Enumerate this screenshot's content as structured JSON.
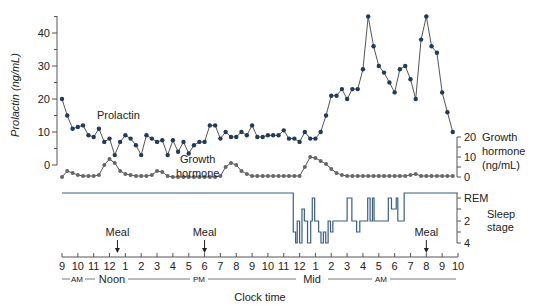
{
  "chart_data": {
    "type": "line",
    "title": "",
    "xlabel": "Clock time",
    "x_tick_labels": [
      "9",
      "10",
      "11",
      "12",
      "1",
      "2",
      "3",
      "4",
      "5",
      "6",
      "7",
      "8",
      "9",
      "10",
      "11",
      "12",
      "1",
      "2",
      "3",
      "4",
      "5",
      "6",
      "7",
      "8",
      "9",
      "10"
    ],
    "x_period_labels": [
      "AM",
      "Noon",
      "PM",
      "Mid",
      "AM"
    ],
    "x_range_hours": [
      9,
      34
    ],
    "panels": [
      {
        "name": "prolactin",
        "ylabel": "Prolactin (ng/mL)",
        "yticks": [
          0,
          10,
          20,
          30,
          40
        ],
        "ylim": [
          0,
          45
        ],
        "series_label": "Prolactin",
        "color": "#1f3a5a",
        "x": [
          9.0,
          9.33,
          9.67,
          10.0,
          10.33,
          10.67,
          11.0,
          11.33,
          11.67,
          12.0,
          12.33,
          12.67,
          13.0,
          13.33,
          13.67,
          14.0,
          14.33,
          14.67,
          15.0,
          15.33,
          15.67,
          16.0,
          16.33,
          16.67,
          17.0,
          17.33,
          17.67,
          18.0,
          18.33,
          18.67,
          19.0,
          19.33,
          19.67,
          20.0,
          20.33,
          20.67,
          21.0,
          21.33,
          21.67,
          22.0,
          22.33,
          22.67,
          23.0,
          23.33,
          23.67,
          24.0,
          24.33,
          24.67,
          25.0,
          25.33,
          25.67,
          26.0,
          26.33,
          26.67,
          27.0,
          27.33,
          27.67,
          28.0,
          28.33,
          28.67,
          29.0,
          29.33,
          29.67,
          30.0,
          30.33,
          30.67,
          31.0,
          31.33,
          31.67,
          32.0,
          32.33,
          32.67,
          33.0,
          33.33,
          33.67
        ],
        "values": [
          20,
          15,
          11,
          11.5,
          12,
          9,
          8.5,
          11,
          7,
          8,
          3,
          7,
          9,
          8,
          6,
          3,
          9,
          8,
          7,
          7.5,
          3,
          7.5,
          4,
          7,
          3.5,
          6,
          7,
          7,
          12,
          12,
          8,
          10,
          8.5,
          8.5,
          10,
          9,
          12,
          8.5,
          8.5,
          9,
          9,
          9,
          10.5,
          8,
          8,
          7,
          10,
          8,
          8,
          10,
          15,
          21,
          21,
          23,
          20,
          23,
          23,
          29,
          45,
          36,
          30,
          28,
          25,
          22,
          29,
          30,
          26,
          20,
          38,
          45,
          36,
          34,
          22,
          16,
          10
        ]
      },
      {
        "name": "growth_hormone",
        "ylabel": "Growth hormone (ng/mL)",
        "yticks": [
          0,
          10,
          20
        ],
        "ylim": [
          0,
          20
        ],
        "series_label": "Growth hormone",
        "color": "#666666",
        "x": [
          9.0,
          9.33,
          9.67,
          10.0,
          10.33,
          10.67,
          11.0,
          11.33,
          11.67,
          12.0,
          12.33,
          12.67,
          13.0,
          13.33,
          13.67,
          14.0,
          14.33,
          14.67,
          15.0,
          15.33,
          15.67,
          16.0,
          16.33,
          16.67,
          17.0,
          17.33,
          17.67,
          18.0,
          18.33,
          18.67,
          19.0,
          19.33,
          19.67,
          20.0,
          20.33,
          20.67,
          21.0,
          21.33,
          21.67,
          22.0,
          22.33,
          22.67,
          23.0,
          23.33,
          23.67,
          24.0,
          24.33,
          24.67,
          25.0,
          25.33,
          25.67,
          26.0,
          26.33,
          26.67,
          27.0,
          27.33,
          27.67,
          28.0,
          28.33,
          28.67,
          29.0,
          29.33,
          29.67,
          30.0,
          30.33,
          30.67,
          31.0,
          31.33,
          31.67,
          32.0,
          32.33,
          32.67,
          33.0,
          33.33,
          33.67
        ],
        "values": [
          0,
          3,
          2,
          1,
          0.5,
          0.5,
          0.5,
          1,
          6,
          9,
          7,
          3,
          1.5,
          1,
          0.5,
          0.5,
          0.5,
          1,
          3,
          2.5,
          0.5,
          0,
          0,
          0,
          0,
          0,
          0,
          0,
          0,
          0,
          0.5,
          5,
          7,
          6,
          3,
          1.5,
          0.5,
          0.5,
          0.5,
          0.5,
          0.5,
          0.5,
          0.5,
          0.5,
          0.5,
          0.5,
          5,
          10,
          9.5,
          8,
          6.5,
          4,
          2,
          1,
          0.5,
          0.5,
          0.5,
          0.5,
          0.5,
          0.5,
          0.5,
          0.5,
          0.5,
          0.5,
          0.5,
          0.5,
          1,
          1.5,
          0.5,
          0.5,
          0.5,
          0.5,
          0.5,
          0.5,
          0.5
        ]
      },
      {
        "name": "sleep_stage",
        "ylabel": "Sleep stage",
        "yticks": [
          "REM",
          "2",
          "4"
        ],
        "series_label": "",
        "color": "#3a5f86",
        "note": "awake until ~23:30, stepped sleep stages until ~07:00, then awake"
      }
    ],
    "annotations": [
      {
        "label": "Meal",
        "x_hour": 12.5
      },
      {
        "label": "Meal",
        "x_hour": 18.0
      },
      {
        "label": "Meal",
        "x_hour": 32.0
      }
    ],
    "grid": false,
    "legend": "inline labels"
  }
}
